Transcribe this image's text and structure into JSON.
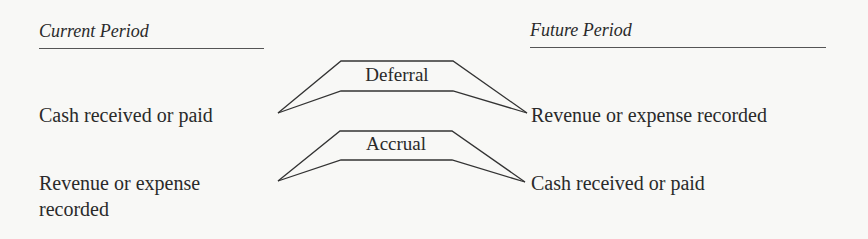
{
  "columns": {
    "current": {
      "heading": "Current Period"
    },
    "future": {
      "heading": "Future Period"
    }
  },
  "rows": [
    {
      "type": "Deferral",
      "current_text": "Cash received or paid",
      "future_text": "Revenue or expense recorded"
    },
    {
      "type": "Accrual",
      "current_text_line1": "Revenue or expense",
      "current_text_line2": "recorded",
      "future_text": "Cash received or paid"
    }
  ]
}
